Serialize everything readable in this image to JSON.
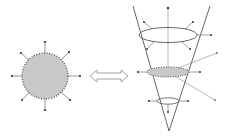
{
  "diagram": {
    "colors": {
      "background": "#ffffff",
      "stroke": "#555555",
      "fill": "#c8c8c8",
      "dots": "#444444",
      "arrow_outline": "#999999"
    },
    "left_figure": {
      "label": "",
      "shape": "circle",
      "arrow_count": 8
    },
    "equivalence_symbol": "double-arrow",
    "right_figure": {
      "label": "",
      "shape": "cone",
      "cross_sections": [
        "top-ellipse",
        "middle-shaded-ellipse",
        "bottom-small-ellipse"
      ]
    }
  }
}
